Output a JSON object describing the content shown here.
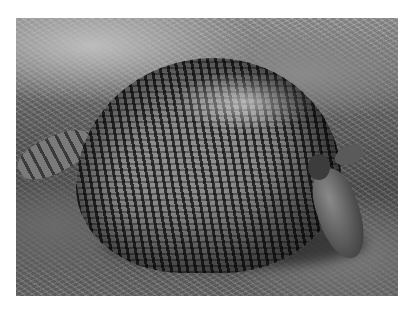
{
  "image": {
    "subject": "armadillo",
    "description": "Black-and-white photograph of a nine-banded armadillo foraging on grassy ground",
    "colors": {
      "background": "#ffffff",
      "ground_light": "#bdbdbd",
      "ground_dark": "#555555",
      "shell_highlight": "#e6e6e6",
      "shell_dark": "#2f2f2f"
    }
  }
}
